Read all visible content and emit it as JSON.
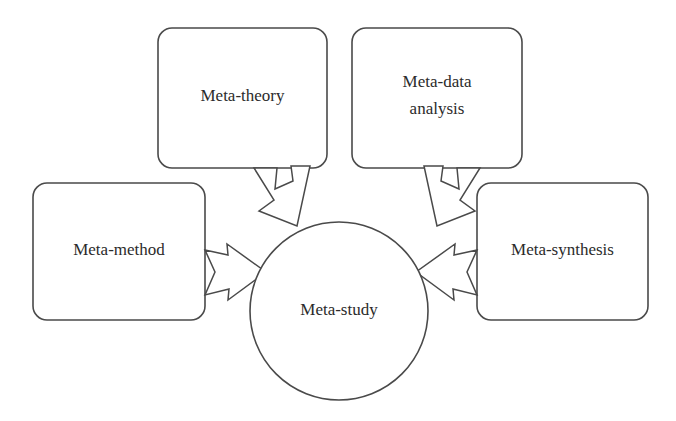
{
  "diagram": {
    "type": "concept-map",
    "background_color": "#ffffff",
    "stroke_color": "#4a4a4a",
    "text_color": "#2b2b2b",
    "center": {
      "id": "meta-study",
      "shape": "circle",
      "label": "Meta-study",
      "cx": 339,
      "cy": 311,
      "r": 89
    },
    "nodes": [
      {
        "id": "meta-theory",
        "shape": "rounded-rectangle",
        "label": "Meta-theory",
        "line1": "Meta-theory",
        "line2": "",
        "x": 158,
        "y": 28,
        "width": 169,
        "height": 140,
        "radius": 14
      },
      {
        "id": "meta-data-analysis",
        "shape": "rounded-rectangle",
        "label": "Meta-data analysis",
        "line1": "Meta-data",
        "line2": "analysis",
        "x": 352,
        "y": 28,
        "width": 170,
        "height": 140,
        "radius": 14
      },
      {
        "id": "meta-method",
        "shape": "rounded-rectangle",
        "label": "Meta-method",
        "line1": "Meta-method",
        "line2": "",
        "x": 33,
        "y": 183,
        "width": 172,
        "height": 137,
        "radius": 14
      },
      {
        "id": "meta-synthesis",
        "shape": "rounded-rectangle",
        "label": "Meta-synthesis",
        "line1": "Meta-synthesis",
        "line2": "",
        "x": 477,
        "y": 183,
        "width": 171,
        "height": 137,
        "radius": 14
      }
    ],
    "arrows": [
      {
        "id": "arrow-meta-theory-to-meta-study",
        "from": "meta-theory",
        "to": "meta-study",
        "style": "hollow-block-arrow",
        "direction": "down-right"
      },
      {
        "id": "arrow-meta-data-analysis-to-meta-study",
        "from": "meta-data-analysis",
        "to": "meta-study",
        "style": "hollow-block-arrow",
        "direction": "down-left"
      },
      {
        "id": "arrow-meta-method-to-meta-study",
        "from": "meta-method",
        "to": "meta-study",
        "style": "hollow-block-arrow",
        "direction": "right"
      },
      {
        "id": "arrow-meta-synthesis-to-meta-study",
        "from": "meta-synthesis",
        "to": "meta-study",
        "style": "hollow-block-arrow",
        "direction": "left"
      }
    ]
  }
}
